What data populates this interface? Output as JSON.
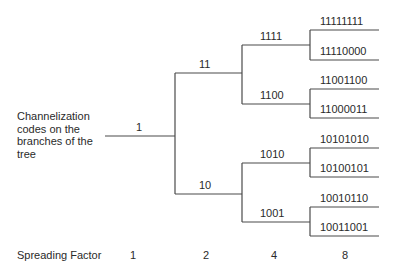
{
  "diagram": {
    "description": "Channelization codes on the branches of the tree",
    "root": "1",
    "level2": [
      "11",
      "10"
    ],
    "level4": [
      "1111",
      "1100",
      "1010",
      "1001"
    ],
    "level8": [
      "11111111",
      "11110000",
      "11001100",
      "11000011",
      "10101010",
      "10100101",
      "10010110",
      "10011001"
    ]
  },
  "axis": {
    "label": "Spreading Factor",
    "values": [
      "1",
      "2",
      "4",
      "8"
    ]
  },
  "colors": {
    "line": "#4a4a4a",
    "text": "#2a2a2a",
    "background": "#ffffff"
  }
}
